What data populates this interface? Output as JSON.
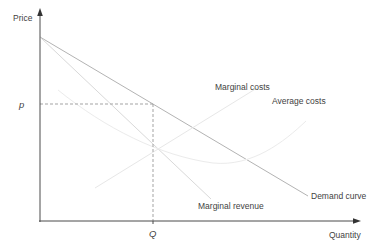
{
  "figure": {
    "background_color": "#ffffff",
    "axes": {
      "y_label": "Price",
      "x_label": "Quantity",
      "color": "#4a4a4a",
      "origin": [
        40,
        221
      ],
      "y_top": 14,
      "x_right": 356
    },
    "markers": {
      "price_label": "p",
      "quantity_label": "Q",
      "price_y": 104,
      "quantity_x": 153,
      "dash_color": "#a3a3a3"
    },
    "curves": [
      {
        "id": "demand",
        "label": "Demand curve",
        "color": "#b3b3b3",
        "points": [
          [
            40,
            37
          ],
          [
            308,
            196
          ]
        ]
      },
      {
        "id": "marginal-revenue",
        "label": "Marginal revenue",
        "color": "#d9d9d9",
        "points": [
          [
            40,
            37
          ],
          [
            211,
            199
          ]
        ]
      },
      {
        "id": "marginal-costs",
        "label": "Marginal costs",
        "color": "#e7e7e7",
        "points": [
          [
            95,
            188
          ],
          [
            257,
            88
          ]
        ]
      },
      {
        "id": "average-costs",
        "label": "Average costs",
        "color": "#ebebeb",
        "path": "M 58,90 C 105,128 160,156 213,163 C 252,167 284,142 306,121"
      }
    ],
    "label_color": "#3f3f3f"
  }
}
